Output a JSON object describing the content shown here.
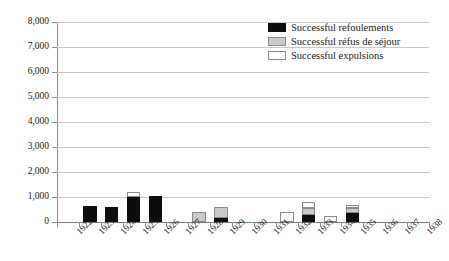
{
  "chart_data": {
    "type": "bar",
    "subtype": "stacked-bar",
    "title": "",
    "xlabel": "",
    "ylabel": "",
    "ylim": [
      0,
      8000
    ],
    "ytick_step": 1000,
    "ytick_labels": [
      "8,000",
      "7,000",
      "6,000",
      "5,000",
      "4,000",
      "3,000",
      "2,000",
      "1,000",
      "0"
    ],
    "ytick_values": [
      8000,
      7000,
      6000,
      5000,
      4000,
      3000,
      2000,
      1000,
      0
    ],
    "grid": true,
    "grid_axis": "y",
    "legend_position": "top-right",
    "categories": [
      "1922",
      "1923",
      "1924",
      "1925",
      "1926",
      "1927",
      "1928",
      "1929",
      "1930",
      "1931",
      "1932",
      "1933",
      "1934",
      "1935",
      "1936",
      "1937",
      "1938"
    ],
    "series": [
      {
        "name": "Successful refoulements",
        "color": "#0d0d0d",
        "values": [
          0,
          650,
          600,
          1000,
          1050,
          0,
          0,
          150,
          0,
          0,
          0,
          300,
          0,
          350,
          0,
          0,
          0
        ]
      },
      {
        "name": "Successful réfus de séjour",
        "color": "#c9c9c9",
        "values": [
          0,
          0,
          0,
          0,
          0,
          0,
          400,
          450,
          0,
          0,
          0,
          250,
          0,
          200,
          0,
          0,
          0
        ]
      },
      {
        "name": "Successful expulsions",
        "color": "#ffffff",
        "values": [
          0,
          0,
          0,
          200,
          0,
          0,
          0,
          0,
          0,
          0,
          400,
          250,
          250,
          150,
          0,
          0,
          0
        ]
      }
    ],
    "totals": [
      0,
      650,
      600,
      1200,
      1050,
      0,
      400,
      600,
      0,
      0,
      400,
      800,
      250,
      700,
      0,
      0,
      0
    ]
  },
  "legend": {
    "items": [
      {
        "label": "Successful refoulements",
        "swatch": "black"
      },
      {
        "label": "Successful réfus de séjour",
        "swatch": "gray"
      },
      {
        "label": "Successful expulsions",
        "swatch": "white"
      }
    ]
  }
}
